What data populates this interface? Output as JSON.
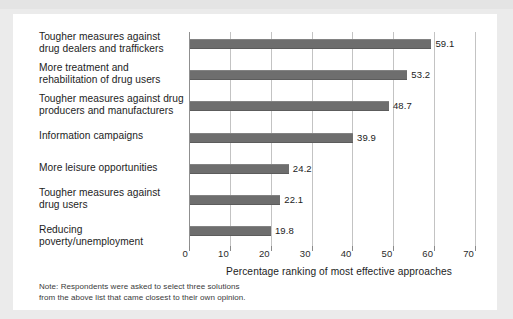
{
  "chart_data": {
    "type": "bar",
    "orientation": "horizontal",
    "title": "",
    "xlabel": "Percentage ranking of most effective approaches",
    "ylabel": "",
    "xlim": [
      0,
      70
    ],
    "xticks": [
      0,
      10,
      20,
      30,
      40,
      50,
      60,
      70
    ],
    "grid": true,
    "legend": false,
    "bar_color": "#6e6e6e",
    "categories": [
      "Tougher measures against drug dealers and traffickers",
      "More treatment and rehabilitation of drug users",
      "Tougher measures against drug producers and manufacturers",
      "Information campaigns",
      "More leisure opportunities",
      "Tougher measures against drug users",
      "Reducing poverty/unemployment"
    ],
    "values": [
      59.1,
      53.2,
      48.7,
      39.9,
      24.2,
      22.1,
      19.8
    ],
    "value_labels": [
      "59.1",
      "53.2",
      "48.7",
      "39.9",
      "24.2",
      "22.1",
      "19.8"
    ],
    "annotations": [
      "Note: Respondents were asked to select three solutions from the above list that came closest to their own opinion."
    ]
  },
  "category_lines": [
    [
      "Tougher measures against",
      "drug dealers and traffickers"
    ],
    [
      "More treatment and",
      "rehabilitation of drug users"
    ],
    [
      "Tougher measures against drug",
      "producers and manufacturers"
    ],
    [
      "Information campaigns"
    ],
    [
      "More leisure opportunities"
    ],
    [
      "Tougher measures against",
      "drug users"
    ],
    [
      "Reducing poverty/unemployment"
    ]
  ],
  "note": {
    "line1": "Note: Respondents were asked to select three solutions",
    "line2": "from the above list that came closest to their own opinion."
  }
}
